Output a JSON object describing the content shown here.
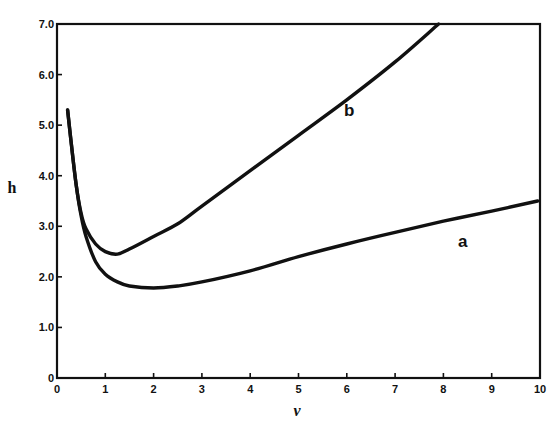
{
  "chart_data": {
    "type": "line",
    "title": "",
    "xlabel": "ν",
    "ylabel": "h",
    "xlim": [
      0,
      10
    ],
    "ylim": [
      0,
      7.0
    ],
    "grid": false,
    "legend": "none (curves labeled inline)",
    "x_ticks": [
      "0",
      "1",
      "2",
      "3",
      "4",
      "5",
      "6",
      "7",
      "8",
      "9",
      "10"
    ],
    "y_ticks": [
      "0",
      "1.0",
      "2.0",
      "3.0",
      "4.0",
      "5.0",
      "6.0",
      "7.0"
    ],
    "series": [
      {
        "name": "a",
        "label_position": {
          "x": 8.4,
          "y": 2.7
        },
        "points": [
          [
            0.22,
            5.3
          ],
          [
            0.3,
            4.6
          ],
          [
            0.4,
            3.8
          ],
          [
            0.5,
            3.2
          ],
          [
            0.6,
            2.8
          ],
          [
            0.8,
            2.3
          ],
          [
            1.0,
            2.05
          ],
          [
            1.25,
            1.9
          ],
          [
            1.5,
            1.82
          ],
          [
            2.0,
            1.78
          ],
          [
            2.5,
            1.82
          ],
          [
            3.0,
            1.9
          ],
          [
            4.0,
            2.12
          ],
          [
            5.0,
            2.4
          ],
          [
            6.0,
            2.65
          ],
          [
            7.0,
            2.88
          ],
          [
            8.0,
            3.1
          ],
          [
            9.0,
            3.3
          ],
          [
            9.95,
            3.5
          ]
        ]
      },
      {
        "name": "b",
        "label_position": {
          "x": 6.05,
          "y": 5.3
        },
        "points": [
          [
            0.22,
            5.3
          ],
          [
            0.3,
            4.6
          ],
          [
            0.4,
            3.8
          ],
          [
            0.5,
            3.25
          ],
          [
            0.6,
            2.95
          ],
          [
            0.8,
            2.65
          ],
          [
            1.0,
            2.5
          ],
          [
            1.25,
            2.45
          ],
          [
            1.5,
            2.55
          ],
          [
            2.0,
            2.8
          ],
          [
            2.5,
            3.05
          ],
          [
            3.0,
            3.4
          ],
          [
            4.0,
            4.1
          ],
          [
            5.0,
            4.8
          ],
          [
            6.0,
            5.5
          ],
          [
            7.0,
            6.25
          ],
          [
            7.9,
            7.0
          ]
        ]
      }
    ]
  },
  "plot": {
    "x_axis_label": "ν",
    "y_axis_label": "h",
    "curve_a_label": "a",
    "curve_b_label": "b"
  }
}
